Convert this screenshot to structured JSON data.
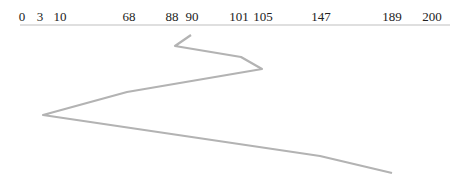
{
  "chart_data": {
    "type": "line",
    "title": "",
    "axis": {
      "position": "top",
      "tick_labels": [
        "0",
        "3",
        "10",
        "68",
        "88",
        "90",
        "101",
        "105",
        "147",
        "189",
        "200"
      ],
      "tick_x_px": [
        22,
        40,
        60,
        129,
        172,
        192,
        239,
        263,
        321,
        392,
        432
      ],
      "xlim": [
        0,
        200
      ]
    },
    "path": {
      "description": "zig-zag polyline descending the page through marked values",
      "sequence": [
        90,
        88,
        101,
        105,
        68,
        3,
        147,
        189
      ],
      "points_px": [
        [
          191,
          35
        ],
        [
          175,
          46
        ],
        [
          241,
          57
        ],
        [
          262,
          69
        ],
        [
          127,
          92
        ],
        [
          43,
          115
        ],
        [
          320,
          156
        ],
        [
          392,
          173
        ]
      ],
      "color": "#b3b3b3"
    },
    "axis_line": {
      "x1": 20,
      "x2": 450,
      "y": 25,
      "color": "#bfbfbf"
    }
  }
}
